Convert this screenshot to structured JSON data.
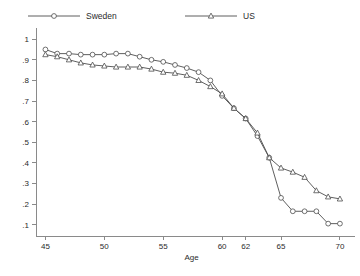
{
  "chart_data": {
    "type": "line",
    "title": "",
    "xlabel": "Age",
    "ylabel": "",
    "xlim": [
      44.2,
      70.6
    ],
    "ylim": [
      0.045,
      1.03
    ],
    "grid": false,
    "legend_position": "top",
    "x_ticks": [
      "45",
      "50",
      "55",
      "60",
      "62",
      "65",
      "70"
    ],
    "x_tick_values": [
      45,
      50,
      55,
      60,
      62,
      65,
      70
    ],
    "y_ticks": [
      ".1",
      ".2",
      ".3",
      ".4",
      ".5",
      ".6",
      ".7",
      ".8",
      ".9",
      "1"
    ],
    "y_tick_values": [
      0.1,
      0.2,
      0.3,
      0.4,
      0.5,
      0.6,
      0.7,
      0.8,
      0.9,
      1.0
    ],
    "x": [
      45,
      46,
      47,
      48,
      49,
      50,
      51,
      52,
      53,
      54,
      55,
      56,
      57,
      58,
      59,
      60,
      61,
      62,
      63,
      64,
      65,
      66,
      67,
      68,
      69,
      70
    ],
    "series": [
      {
        "name": "Sweden",
        "marker": "circle",
        "values": [
          0.95,
          0.93,
          0.93,
          0.925,
          0.925,
          0.925,
          0.93,
          0.93,
          0.915,
          0.9,
          0.89,
          0.875,
          0.86,
          0.84,
          0.8,
          0.725,
          0.665,
          0.615,
          0.53,
          0.425,
          0.23,
          0.165,
          0.165,
          0.165,
          0.105,
          0.105
        ]
      },
      {
        "name": "US",
        "marker": "triangle",
        "values": [
          0.925,
          0.915,
          0.9,
          0.885,
          0.875,
          0.87,
          0.865,
          0.865,
          0.865,
          0.855,
          0.84,
          0.835,
          0.825,
          0.8,
          0.77,
          0.735,
          0.665,
          0.615,
          0.545,
          0.425,
          0.375,
          0.355,
          0.33,
          0.265,
          0.235,
          0.225
        ]
      }
    ]
  },
  "legend": {
    "items": [
      {
        "label": "Sweden",
        "marker": "circle"
      },
      {
        "label": "US",
        "marker": "triangle"
      }
    ]
  }
}
